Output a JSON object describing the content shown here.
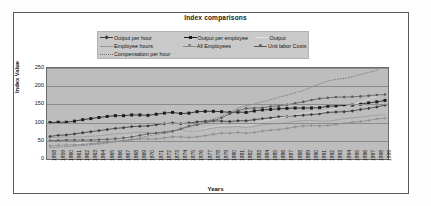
{
  "chart_data": {
    "type": "line",
    "title": "Index comparisons",
    "xlabel": "Years",
    "ylabel": "Index Value",
    "ylim": [
      0,
      250
    ],
    "yticks": [
      0,
      50,
      100,
      150,
      200,
      250
    ],
    "grid": true,
    "legend_position": "top",
    "plot_bg": "#bdbdbd",
    "categories": [
      "1958",
      "1959",
      "1960",
      "1961",
      "1962",
      "1963",
      "1964",
      "1965",
      "1966",
      "1967",
      "1968",
      "1969",
      "1970",
      "1971",
      "1972",
      "1973",
      "1974",
      "1975",
      "1976",
      "1977",
      "1978",
      "1979",
      "1980",
      "1981",
      "1982",
      "1983",
      "1984",
      "1985",
      "1986",
      "1987",
      "1988",
      "1989",
      "1990",
      "1991",
      "1992",
      "1993",
      "1994",
      "1995",
      "1996",
      "1997",
      "1998",
      "1999"
    ],
    "series": [
      {
        "name": "Output per hour",
        "color": "#3c3c3c",
        "marker": "diamond",
        "values": [
          62,
          65,
          66,
          69,
          72,
          75,
          78,
          81,
          84,
          86,
          89,
          90,
          91,
          94,
          97,
          99,
          97,
          99,
          102,
          104,
          105,
          104,
          103,
          105,
          105,
          108,
          111,
          113,
          116,
          117,
          119,
          120,
          122,
          124,
          128,
          129,
          130,
          132,
          136,
          139,
          143,
          148
        ]
      },
      {
        "name": "Output per employee",
        "color": "#1c1c1c",
        "marker": "square",
        "values": [
          100,
          101,
          101,
          104,
          108,
          111,
          114,
          117,
          119,
          119,
          121,
          121,
          120,
          123,
          126,
          128,
          125,
          126,
          130,
          131,
          131,
          130,
          128,
          129,
          128,
          132,
          135,
          136,
          138,
          139,
          140,
          140,
          140,
          141,
          145,
          146,
          147,
          148,
          151,
          154,
          157,
          161
        ]
      },
      {
        "name": "Output",
        "color": "#d8d8d8",
        "marker": "none",
        "values": [
          36,
          39,
          40,
          41,
          44,
          47,
          50,
          54,
          58,
          60,
          64,
          67,
          66,
          68,
          73,
          78,
          76,
          74,
          79,
          84,
          89,
          92,
          91,
          94,
          91,
          96,
          104,
          108,
          112,
          117,
          123,
          127,
          129,
          128,
          133,
          138,
          144,
          149,
          156,
          164,
          172,
          181
        ]
      },
      {
        "name": "Employee hours",
        "color": "#9a9a9a",
        "marker": "none",
        "values": [
          58,
          60,
          61,
          60,
          61,
          62,
          64,
          66,
          69,
          70,
          72,
          74,
          72,
          72,
          75,
          79,
          78,
          75,
          77,
          81,
          85,
          88,
          88,
          89,
          87,
          89,
          94,
          96,
          97,
          100,
          103,
          106,
          106,
          104,
          104,
          107,
          111,
          113,
          115,
          118,
          120,
          122
        ]
      },
      {
        "name": "All Employees",
        "color": "#8a8a8a",
        "marker": "plus",
        "values": [
          36,
          38,
          39,
          39,
          40,
          42,
          44,
          46,
          49,
          50,
          53,
          55,
          55,
          55,
          58,
          61,
          61,
          59,
          61,
          64,
          68,
          71,
          71,
          73,
          71,
          73,
          77,
          79,
          81,
          84,
          88,
          91,
          92,
          91,
          92,
          95,
          98,
          101,
          103,
          106,
          110,
          112
        ]
      },
      {
        "name": "Unit labor Costs",
        "color": "#5c5c5c",
        "marker": "circle",
        "values": [
          50,
          51,
          52,
          52,
          52,
          52,
          53,
          54,
          56,
          58,
          61,
          65,
          69,
          71,
          73,
          76,
          83,
          90,
          94,
          99,
          105,
          113,
          124,
          133,
          139,
          140,
          141,
          144,
          146,
          149,
          153,
          157,
          162,
          166,
          168,
          170,
          170,
          171,
          172,
          174,
          176,
          177
        ]
      },
      {
        "name": "Compensation per hour",
        "color": "#707070",
        "marker": "none",
        "values": [
          31,
          33,
          34,
          36,
          37,
          39,
          41,
          44,
          47,
          50,
          54,
          58,
          63,
          67,
          71,
          76,
          81,
          89,
          96,
          103,
          110,
          118,
          128,
          140,
          146,
          151,
          157,
          163,
          170,
          175,
          182,
          188,
          198,
          206,
          214,
          219,
          221,
          226,
          232,
          238,
          243,
          262
        ]
      }
    ],
    "legend": [
      {
        "label": "Output per hour",
        "color": "#3c3c3c",
        "marker": "diamond",
        "col": 1,
        "row": 1
      },
      {
        "label": "Output per employee",
        "color": "#1c1c1c",
        "marker": "square",
        "col": 2,
        "row": 1
      },
      {
        "label": "Output",
        "color": "#dcdcdc",
        "marker": "none",
        "col": 3,
        "row": 1
      },
      {
        "label": "Employee hours",
        "color": "#9a9a9a",
        "marker": "none",
        "col": 1,
        "row": 2
      },
      {
        "label": "All Employees",
        "color": "#8a8a8a",
        "marker": "plus",
        "col": 2,
        "row": 2
      },
      {
        "label": "Unit labor Costs",
        "color": "#5c5c5c",
        "marker": "circle",
        "col": 3,
        "row": 2
      },
      {
        "label": "Compensation per hour",
        "color": "#7a7a7a",
        "marker": "dots",
        "col": 1,
        "row": 3
      }
    ]
  }
}
